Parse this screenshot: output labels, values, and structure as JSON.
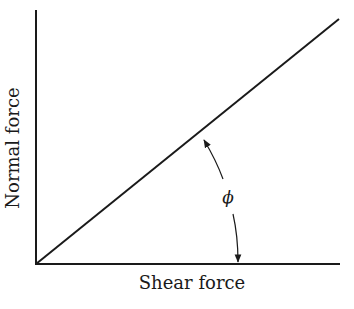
{
  "diagram": {
    "type": "friction-angle-diagram",
    "x_axis_label": "Shear force",
    "y_axis_label": "Normal force",
    "angle_symbol": "ϕ",
    "ink_color": "#1a1a1a",
    "background": "#ffffff"
  }
}
